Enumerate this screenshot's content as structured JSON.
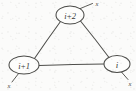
{
  "figure": {
    "type": "diagram",
    "background_color": "#fbfbfa",
    "ink_color": "#4a4a47",
    "style": "hand-drawn scan"
  },
  "nodes": [
    {
      "id": "node-top",
      "label": "i+2",
      "cx": 70,
      "cy": 15,
      "rx": 14,
      "ry": 9
    },
    {
      "id": "node-bottom-left",
      "label": "i+1",
      "cx": 24,
      "cy": 65,
      "rx": 15,
      "ry": 9
    },
    {
      "id": "node-bottom-right",
      "label": "i",
      "cx": 117,
      "cy": 64,
      "rx": 13,
      "ry": 8.5
    }
  ],
  "edges": [
    {
      "id": "edge-topleft",
      "from": "node-top",
      "to": "node-bottom-left"
    },
    {
      "id": "edge-topright",
      "from": "node-top",
      "to": "node-bottom-right"
    },
    {
      "id": "edge-bottom",
      "from": "node-bottom-left",
      "to": "node-bottom-right"
    }
  ],
  "stubs": [
    {
      "id": "stub-top",
      "label": "x",
      "from_node": "node-top",
      "direction": "up-right"
    },
    {
      "id": "stub-bottom-left",
      "label": "x",
      "from_node": "node-bottom-left",
      "direction": "down-left"
    },
    {
      "id": "stub-bottom-right",
      "label": "x",
      "from_node": "node-bottom-right",
      "direction": "down-right"
    }
  ]
}
